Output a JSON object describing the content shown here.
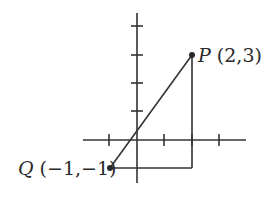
{
  "diagram": {
    "type": "coordinate-plane",
    "axes": {
      "x_ticks": [
        -1,
        1,
        2,
        3
      ],
      "y_ticks": [
        1,
        2,
        3,
        4
      ],
      "x_range": [
        -2,
        4
      ],
      "y_range": [
        -1.5,
        4.5
      ]
    },
    "points": [
      {
        "id": "P",
        "name": "P",
        "coords": "(2,3)",
        "x": 2,
        "y": 3
      },
      {
        "id": "Q",
        "name": "Q",
        "coords": "(−1,−1)",
        "x": -1,
        "y": -1
      }
    ],
    "segments": [
      {
        "from": "Q",
        "to": "P",
        "label": "hypotenuse"
      },
      {
        "from": "Q",
        "to": "R",
        "label": "horizontal leg"
      },
      {
        "from": "R",
        "to": "P",
        "label": "vertical leg"
      }
    ],
    "right_angle_vertex": {
      "x": 2,
      "y": -1
    },
    "colors": {
      "ink": "#333333",
      "background": "#ffffff"
    }
  },
  "labels": {
    "p_name": "P",
    "p_coords": " (2,3)",
    "q_name": "Q",
    "q_coords": " (−1,−1)"
  }
}
